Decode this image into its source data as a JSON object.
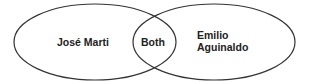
{
  "diagram": {
    "type": "venn",
    "sets": [
      {
        "id": "left",
        "label": "José Marti"
      },
      {
        "id": "right",
        "label_lines": [
          "Emilio",
          "Aguinaldo"
        ]
      }
    ],
    "intersection": {
      "label": "Both"
    },
    "colors": {
      "stroke": "#333333",
      "fill": "#ffffff",
      "text": "#222222"
    }
  }
}
